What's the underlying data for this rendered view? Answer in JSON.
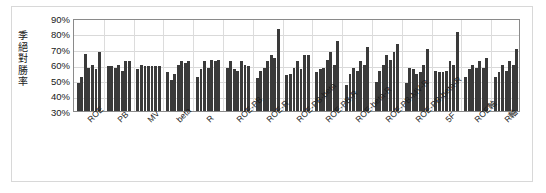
{
  "chart_data": {
    "type": "bar",
    "title": "",
    "xlabel": "",
    "ylabel": "季絕對勝率",
    "ylim": [
      0.3,
      0.9
    ],
    "ytick_labels": [
      "90%",
      "80%",
      "70%",
      "60%",
      "50%",
      "40%",
      "30%"
    ],
    "ytick_values": [
      0.9,
      0.8,
      0.7,
      0.6,
      0.5,
      0.4,
      0.3
    ],
    "grid": true,
    "legend": "none",
    "categories": [
      "ROE",
      "PB",
      "MV",
      "beta",
      "R",
      "ROE-PB",
      "ROE-R",
      "ROE-PB-beta",
      "ROE-PB-R",
      "ROE-beta-R",
      "ROE-PB-MV-R",
      "ROE-PB-beta-R",
      "5F",
      "ROE軸",
      "R軸"
    ],
    "groups": [
      {
        "label": "ROE",
        "values": [
          0.48,
          0.52,
          0.67,
          0.58,
          0.6,
          0.57,
          0.68
        ]
      },
      {
        "label": "PB",
        "values": [
          0.59,
          0.59,
          0.58,
          0.6,
          0.56,
          0.62,
          0.62
        ]
      },
      {
        "label": "MV",
        "values": [
          0.57,
          0.6,
          0.59,
          0.59,
          0.59,
          0.59,
          0.59
        ]
      },
      {
        "label": "beta",
        "values": [
          0.55,
          0.5,
          0.54,
          0.6,
          0.62,
          0.61,
          0.62
        ]
      },
      {
        "label": "R",
        "values": [
          0.52,
          0.57,
          0.62,
          0.58,
          0.63,
          0.62,
          0.63
        ]
      },
      {
        "label": "ROE-PB",
        "values": [
          0.58,
          0.62,
          0.57,
          0.56,
          0.62,
          0.6,
          0.59
        ]
      },
      {
        "label": "ROE-R",
        "values": [
          0.51,
          0.56,
          0.58,
          0.62,
          0.66,
          0.64,
          0.83
        ]
      },
      {
        "label": "ROE-PB-beta",
        "values": [
          0.53,
          0.54,
          0.58,
          0.62,
          0.57,
          0.66,
          0.66
        ]
      },
      {
        "label": "ROE-PB-R",
        "values": [
          0.55,
          0.57,
          0.58,
          0.63,
          0.68,
          0.6,
          0.75
        ]
      },
      {
        "label": "ROE-beta-R",
        "values": [
          0.47,
          0.54,
          0.58,
          0.56,
          0.62,
          0.6,
          0.71
        ]
      },
      {
        "label": "ROE-PB-MV-R",
        "values": [
          0.49,
          0.56,
          0.6,
          0.66,
          0.63,
          0.68,
          0.73
        ]
      },
      {
        "label": "ROE-PB-beta-R",
        "values": [
          0.48,
          0.58,
          0.57,
          0.54,
          0.55,
          0.6,
          0.7
        ]
      },
      {
        "label": "5F",
        "values": [
          0.56,
          0.55,
          0.55,
          0.56,
          0.62,
          0.6,
          0.81
        ]
      },
      {
        "label": "ROE軸",
        "values": [
          0.52,
          0.57,
          0.6,
          0.58,
          0.62,
          0.58,
          0.64
        ]
      },
      {
        "label": "R軸",
        "values": [
          0.52,
          0.55,
          0.6,
          0.56,
          0.62,
          0.6,
          0.7
        ]
      }
    ],
    "bar_color": "#3a3a3a"
  },
  "axis": {
    "y_title_chars": [
      "季",
      "絕",
      "對",
      "勝",
      "率"
    ]
  }
}
